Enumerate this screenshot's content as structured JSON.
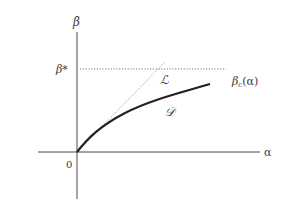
{
  "diagram": {
    "axes": {
      "x_label": "α",
      "y_label": "β",
      "origin_label": "0"
    },
    "threshold": {
      "label": "β*"
    },
    "curves": {
      "line_label": "ℒ",
      "curve_label": "𝒟",
      "boundary_label": "βc(α)",
      "boundary_symbol": "β",
      "boundary_sub": "c",
      "boundary_arg": "(α)"
    },
    "colors": {
      "axis": "#4a4a4a",
      "curve": "#222222",
      "dotted": "#777777",
      "text": "#3a3a3a"
    }
  }
}
